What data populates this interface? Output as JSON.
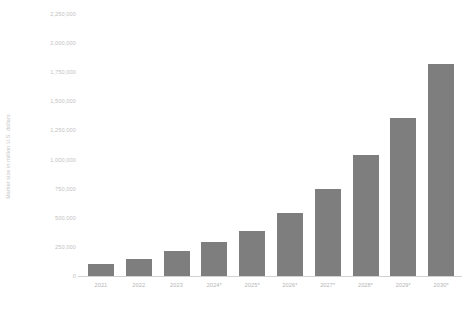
{
  "chart_data": {
    "type": "bar",
    "title": "",
    "subtitle": "",
    "xlabel": "",
    "ylabel": "Market size in million U.S. dollars",
    "categories": [
      "2021",
      "2022",
      "2023",
      "2024*",
      "2025*",
      "2026*",
      "2027*",
      "2028*",
      "2029*",
      "2030*"
    ],
    "values": [
      100000,
      150000,
      215000,
      290000,
      390000,
      545000,
      745000,
      1040000,
      1355000,
      1820000
    ],
    "series": [
      {
        "name": "Market size",
        "values": [
          100000,
          150000,
          215000,
          290000,
          390000,
          545000,
          745000,
          1040000,
          1355000,
          1820000
        ]
      }
    ],
    "ylim": [
      0,
      2250000
    ],
    "y_ticks": [
      0,
      250000,
      500000,
      750000,
      1000000,
      1250000,
      1500000,
      1750000,
      2000000,
      2250000
    ],
    "y_tick_labels": [
      "0",
      "250,000",
      "500,000",
      "750,000",
      "1,000,000",
      "1,250,000",
      "1,500,000",
      "1,750,000",
      "2,000,000",
      "2,250,000"
    ],
    "grid": false,
    "legend": false,
    "legend_position": "none",
    "bar_color": "#7e7e7e",
    "axis_color": "#d2d2d2",
    "tick_label_color": "#c2c2c2",
    "background_color": "#ffffff",
    "annotations": []
  },
  "axis": {
    "y_title": "Market size in million U.S. dollars"
  }
}
